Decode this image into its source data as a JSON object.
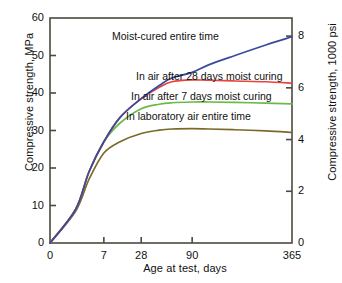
{
  "chart_data": {
    "type": "line",
    "title": "",
    "xlabel": "Age at test, days",
    "ylabel": "Compressive strength, MPa",
    "ylabel_right": "Compressive strength, 1000 psi",
    "xticks": [
      0,
      7,
      28,
      90,
      365
    ],
    "xtick_labels": [
      "0",
      "7",
      "28",
      "90",
      "365"
    ],
    "yticks": [
      0,
      10,
      20,
      30,
      40,
      50,
      60
    ],
    "ytick_labels": [
      "0",
      "10",
      "20",
      "30",
      "40",
      "50",
      "60"
    ],
    "yticks_right": [
      0,
      2,
      4,
      6,
      8
    ],
    "ytick_labels_right": [
      "0",
      "2",
      "4",
      "6",
      "8"
    ],
    "ylim": [
      0,
      60
    ],
    "ylim_right": [
      0,
      8.7
    ],
    "xlim": [
      0,
      365
    ],
    "grid": false,
    "legend_position": "inline-annotations",
    "series": [
      {
        "name": "Moist-cured entire time",
        "color": "#3a4a9f",
        "x": [
          0,
          1,
          3,
          7,
          14,
          28,
          45,
          60,
          90,
          120,
          180,
          270,
          365
        ],
        "values": [
          0,
          9,
          19,
          27,
          33.5,
          38.5,
          42,
          44,
          45.5,
          47.5,
          50,
          52.8,
          55
        ]
      },
      {
        "name": "In air after 28 days moist curing",
        "color": "#e8443c",
        "x": [
          0,
          1,
          3,
          7,
          14,
          28,
          45,
          60,
          90,
          120,
          180,
          270,
          365
        ],
        "values": [
          0,
          9,
          19,
          27,
          33.5,
          38.5,
          41.5,
          43,
          43.5,
          43.4,
          43.2,
          43,
          42.6
        ]
      },
      {
        "name": "In air after 7 days moist curing",
        "color": "#6aba4a",
        "x": [
          0,
          1,
          3,
          7,
          14,
          28,
          45,
          60,
          90,
          120,
          180,
          270,
          365
        ],
        "values": [
          0,
          9,
          19,
          27,
          32,
          35.8,
          37,
          37.4,
          37.6,
          37.6,
          37.5,
          37.3,
          37.1
        ]
      },
      {
        "name": "In laboratory air entire time",
        "color": "#7a6a2a",
        "x": [
          0,
          1,
          3,
          7,
          14,
          28,
          45,
          60,
          90,
          120,
          180,
          270,
          365
        ],
        "values": [
          0,
          8.5,
          17,
          24,
          27,
          29.2,
          30.1,
          30.4,
          30.5,
          30.4,
          30.2,
          29.9,
          29.5
        ]
      }
    ],
    "annotations": [
      {
        "text": "Moist-cured entire time",
        "for": "Moist-cured entire time"
      },
      {
        "text": "In air after 28 days moist curing",
        "for": "In air after 28 days moist curing"
      },
      {
        "text": "In air after 7 days moist curing",
        "for": "In air after 7 days moist curing"
      },
      {
        "text": "In laboratory air entire time",
        "for": "In laboratory air entire time"
      }
    ]
  }
}
